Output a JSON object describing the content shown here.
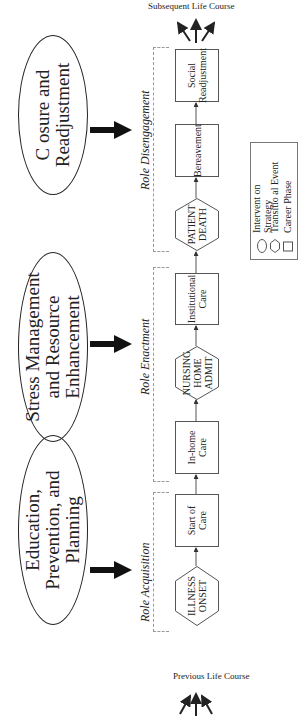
{
  "interventions": [
    {
      "label": "Education, Prevention, and Planning"
    },
    {
      "label": "Stress Management and Resource Enhancement"
    },
    {
      "label": "C osure and Readjustment"
    }
  ],
  "roles": [
    {
      "label": "Role Acquisition"
    },
    {
      "label": "Role Enactment"
    },
    {
      "label": "Role Disengagement"
    }
  ],
  "steps": [
    {
      "label": "ILLNESS ONSET",
      "type": "transitional_event"
    },
    {
      "label": "Start of Care",
      "type": "career_phase"
    },
    {
      "label": "In-home Care",
      "type": "career_phase"
    },
    {
      "label": "NURSING HOME ADMIT",
      "type": "transitional_event"
    },
    {
      "label": "Institutional Care",
      "type": "career_phase"
    },
    {
      "label": "PATIENT DEATH",
      "type": "transitional_event"
    },
    {
      "label": "Bereavement",
      "type": "career_phase"
    },
    {
      "label": "Social Readjustment",
      "type": "career_phase"
    }
  ],
  "life_course": {
    "previous": "Previous Life Course",
    "subsequent": "Subsequent Life Course"
  },
  "legend": {
    "items": [
      {
        "symbol": "oval",
        "label": "Intervent on Strategy"
      },
      {
        "symbol": "hexagon",
        "label": "Transitio al Event"
      },
      {
        "symbol": "square",
        "label": "Career Phase"
      }
    ]
  }
}
